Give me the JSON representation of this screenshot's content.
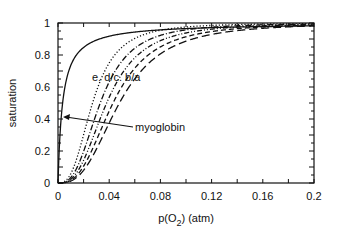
{
  "chart_data": {
    "type": "line",
    "title": "",
    "xlabel": "p(O2)   (atm)",
    "ylabel": "saturation",
    "xlim": [
      0,
      0.2
    ],
    "ylim": [
      0,
      1
    ],
    "xticks": [
      "0",
      "0.04",
      "0.08",
      "0.12",
      "0.16",
      "0.2"
    ],
    "yticks": [
      "0",
      "0.2",
      "0.4",
      "0.6",
      "0.8",
      "1"
    ],
    "grid": false,
    "legend": "inline labels",
    "annotations": [
      {
        "text": "myoglobin",
        "arrow_to": [
          0.003,
          0.41
        ]
      },
      {
        "text": "e. d/c. b/a",
        "position": [
          0.033,
          0.66
        ]
      }
    ],
    "x": [
      0,
      0.005,
      0.01,
      0.015,
      0.02,
      0.025,
      0.03,
      0.035,
      0.04,
      0.05,
      0.06,
      0.08,
      0.1,
      0.12,
      0.14,
      0.16,
      0.18,
      0.2
    ],
    "series": [
      {
        "name": "myoglobin",
        "style": "solid",
        "p50": 0.0036,
        "n": 1
      },
      {
        "name": "e",
        "style": "dotted",
        "p50": 0.027,
        "n": 2.8
      },
      {
        "name": "d",
        "style": "dashdot",
        "p50": 0.033,
        "n": 2.8
      },
      {
        "name": "c",
        "style": "dashdotdot",
        "p50": 0.038,
        "n": 2.8
      },
      {
        "name": "b",
        "style": "dashed",
        "p50": 0.043,
        "n": 2.8
      },
      {
        "name": "a",
        "style": "longdash",
        "p50": 0.048,
        "n": 2.8
      }
    ]
  },
  "labels": {
    "ylabel": "saturation",
    "xlabel_main": "p(O",
    "xlabel_sub": "2",
    "xlabel_tail": ")   (atm)",
    "curve_labels": "e. d/c. b/a",
    "myoglobin": "myoglobin"
  }
}
